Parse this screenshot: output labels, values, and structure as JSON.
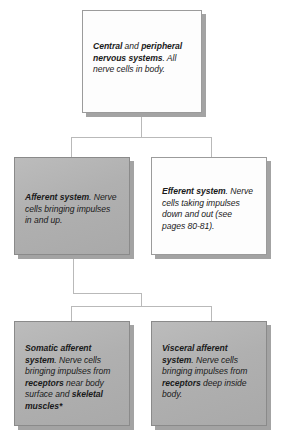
{
  "diagram": {
    "type": "flowchart",
    "orientation": "top-down",
    "colors": {
      "box_fill_gray": "#b3b3b3",
      "box_fill_white": "#fdfdfd",
      "box_border": "#8a8a8a",
      "connector": "#b9b9b9",
      "text": "#1a1a1a",
      "shadow": "#a3a3a3"
    },
    "nodes": [
      {
        "id": "central-peripheral",
        "level": 1,
        "fill": "white",
        "text_runs": [
          {
            "text": "Central",
            "bold": true
          },
          {
            "text": " and ",
            "bold": false
          },
          {
            "text": "peripheral nervous systems",
            "bold": true
          },
          {
            "text": ". All nerve cells in body.",
            "bold": false
          }
        ]
      },
      {
        "id": "afferent-system",
        "level": 2,
        "fill": "gray",
        "text_runs": [
          {
            "text": "Afferent system",
            "bold": true
          },
          {
            "text": ". Nerve cells bringing impulses in and up.",
            "bold": false
          }
        ]
      },
      {
        "id": "efferent-system",
        "level": 2,
        "fill": "white",
        "text_runs": [
          {
            "text": "Efferent system",
            "bold": true
          },
          {
            "text": ". Nerve cells taking impulses down and out (see pages 80-81).",
            "bold": false
          }
        ]
      },
      {
        "id": "somatic-afferent-system",
        "level": 3,
        "fill": "gray",
        "text_runs": [
          {
            "text": "Somatic afferent system",
            "bold": true
          },
          {
            "text": ". Nerve cells bringing impulses from ",
            "bold": false
          },
          {
            "text": "receptors",
            "bold": true
          },
          {
            "text": " near body surface and ",
            "bold": false
          },
          {
            "text": "skeletal muscles*",
            "bold": true
          }
        ]
      },
      {
        "id": "visceral-afferent-system",
        "level": 3,
        "fill": "gray",
        "text_runs": [
          {
            "text": "Visceral afferent system",
            "bold": true
          },
          {
            "text": ". Nerve cells bringing impulses from ",
            "bold": false
          },
          {
            "text": "receptors",
            "bold": true
          },
          {
            "text": " deep inside body.",
            "bold": false
          }
        ]
      }
    ],
    "edges": [
      {
        "from": "central-peripheral",
        "to": "afferent-system"
      },
      {
        "from": "central-peripheral",
        "to": "efferent-system"
      },
      {
        "from": "afferent-system",
        "to": "somatic-afferent-system"
      },
      {
        "from": "afferent-system",
        "to": "visceral-afferent-system"
      }
    ]
  }
}
